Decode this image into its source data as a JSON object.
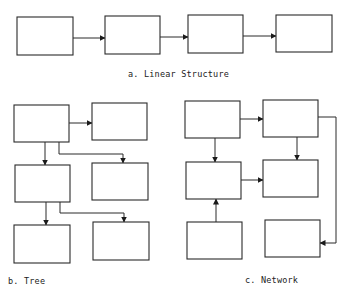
{
  "colors": {
    "stroke": "#2a2a2a",
    "background": "#ffffff",
    "text": "#222222"
  },
  "diagrams": {
    "linear": {
      "caption": "a. Linear Structure",
      "caption_pos": {
        "x": 128,
        "y": 69
      },
      "nodes": [
        {
          "id": "a1",
          "x": 17,
          "y": 17,
          "w": 56,
          "h": 38
        },
        {
          "id": "a2",
          "x": 105,
          "y": 16,
          "w": 55,
          "h": 38
        },
        {
          "id": "a3",
          "x": 188,
          "y": 15,
          "w": 55,
          "h": 38
        },
        {
          "id": "a4",
          "x": 276,
          "y": 15,
          "w": 56,
          "h": 37
        }
      ],
      "edges": [
        {
          "from": "a1",
          "to": "a2",
          "points": [
            [
              73,
              38
            ],
            [
              105,
              38
            ]
          ]
        },
        {
          "from": "a2",
          "to": "a3",
          "points": [
            [
              160,
              37
            ],
            [
              188,
              37
            ]
          ]
        },
        {
          "from": "a3",
          "to": "a4",
          "points": [
            [
              243,
              36
            ],
            [
              276,
              36
            ]
          ]
        }
      ]
    },
    "tree": {
      "caption": "b. Tree",
      "caption_pos": {
        "x": 8,
        "y": 276
      },
      "nodes": [
        {
          "id": "b1",
          "x": 14,
          "y": 105,
          "w": 55,
          "h": 37
        },
        {
          "id": "b2",
          "x": 92,
          "y": 103,
          "w": 55,
          "h": 37
        },
        {
          "id": "b3",
          "x": 15,
          "y": 165,
          "w": 55,
          "h": 37
        },
        {
          "id": "b4",
          "x": 92,
          "y": 163,
          "w": 56,
          "h": 37
        },
        {
          "id": "b5",
          "x": 14,
          "y": 225,
          "w": 56,
          "h": 38
        },
        {
          "id": "b6",
          "x": 93,
          "y": 222,
          "w": 56,
          "h": 38
        }
      ],
      "edges": [
        {
          "from": "b1",
          "to": "b2",
          "points": [
            [
              69,
              123
            ],
            [
              92,
              123
            ]
          ]
        },
        {
          "from": "b1",
          "to": "b3",
          "points": [
            [
              45,
              142
            ],
            [
              45,
              165
            ]
          ]
        },
        {
          "from": "b1",
          "to": "b4",
          "points": [
            [
              59,
              142
            ],
            [
              59,
              154
            ],
            [
              123,
              154
            ],
            [
              123,
              163
            ]
          ]
        },
        {
          "from": "b3",
          "to": "b5",
          "points": [
            [
              46,
              202
            ],
            [
              46,
              225
            ]
          ]
        },
        {
          "from": "b3",
          "to": "b6",
          "points": [
            [
              60,
              202
            ],
            [
              60,
              213
            ],
            [
              124,
              213
            ],
            [
              124,
              222
            ]
          ]
        }
      ]
    },
    "network": {
      "caption": "c. Network",
      "caption_pos": {
        "x": 245,
        "y": 275
      },
      "nodes": [
        {
          "id": "c1",
          "x": 185,
          "y": 101,
          "w": 55,
          "h": 37
        },
        {
          "id": "c2",
          "x": 263,
          "y": 100,
          "w": 55,
          "h": 37
        },
        {
          "id": "c3",
          "x": 186,
          "y": 162,
          "w": 55,
          "h": 37
        },
        {
          "id": "c4",
          "x": 263,
          "y": 160,
          "w": 55,
          "h": 37
        },
        {
          "id": "c5",
          "x": 187,
          "y": 222,
          "w": 55,
          "h": 37
        },
        {
          "id": "c6",
          "x": 265,
          "y": 220,
          "w": 55,
          "h": 37
        }
      ],
      "edges": [
        {
          "from": "c1",
          "to": "c2",
          "points": [
            [
              240,
              119
            ],
            [
              263,
              119
            ]
          ]
        },
        {
          "from": "c1",
          "to": "c3",
          "points": [
            [
              215,
              138
            ],
            [
              215,
              162
            ]
          ]
        },
        {
          "from": "c2",
          "to": "c4",
          "points": [
            [
              297,
              137
            ],
            [
              297,
              160
            ]
          ]
        },
        {
          "from": "c3",
          "to": "c4",
          "points": [
            [
              241,
              180
            ],
            [
              263,
              180
            ]
          ]
        },
        {
          "from": "c5",
          "to": "c3",
          "points": [
            [
              216,
              222
            ],
            [
              216,
              199
            ]
          ]
        },
        {
          "from": "c2",
          "to": "c6",
          "points": [
            [
              318,
              117
            ],
            [
              336,
              117
            ],
            [
              336,
              243
            ],
            [
              320,
              243
            ]
          ]
        }
      ]
    }
  }
}
